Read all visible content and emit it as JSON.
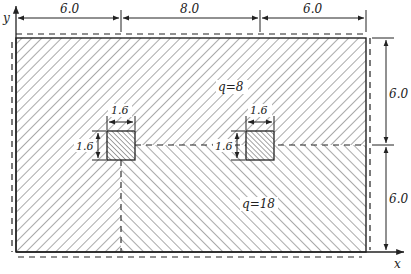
{
  "diagram": {
    "axes": {
      "x_label": "x",
      "y_label": "y"
    },
    "top_dimensions": [
      {
        "label": "6.0",
        "from_x": 16,
        "to_x": 121
      },
      {
        "label": "8.0",
        "from_x": 121,
        "to_x": 260
      },
      {
        "label": "6.0",
        "from_x": 260,
        "to_x": 366
      }
    ],
    "right_dimensions": [
      {
        "label": "6.0",
        "from_y": 38,
        "to_y": 145
      },
      {
        "label": "6.0",
        "from_y": 145,
        "to_y": 252
      }
    ],
    "regions": [
      {
        "name": "upper",
        "load_label": "q=8"
      },
      {
        "name": "lower-right",
        "load_label": "q=18"
      }
    ],
    "columns": [
      {
        "name": "left-column",
        "width_label": "1.6",
        "height_label": "1.6"
      },
      {
        "name": "right-column",
        "width_label": "1.6",
        "height_label": "1.6"
      }
    ],
    "colors": {
      "line": "#222222",
      "hatch": "#555555",
      "background": "#ffffff"
    }
  }
}
